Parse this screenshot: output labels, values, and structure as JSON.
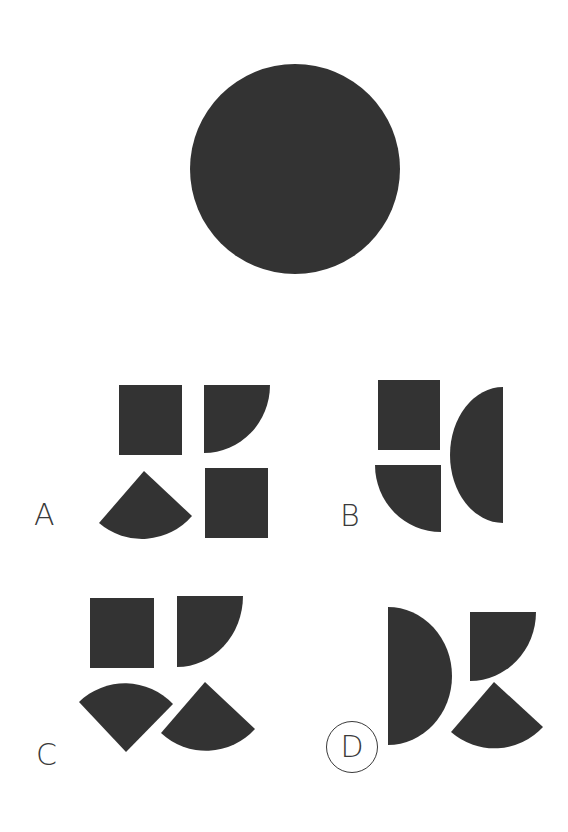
{
  "puzzle": {
    "target": {
      "shape": "circle",
      "color": "#333333"
    },
    "options": [
      {
        "label": "A",
        "selected": false,
        "pieces": [
          "square",
          "quarter-circle",
          "quarter-sector",
          "square"
        ]
      },
      {
        "label": "B",
        "selected": false,
        "pieces": [
          "square",
          "quarter-circle",
          "half-circle"
        ]
      },
      {
        "label": "C",
        "selected": false,
        "pieces": [
          "square",
          "quarter-circle",
          "quarter-sector",
          "quarter-sector"
        ]
      },
      {
        "label": "D",
        "selected": true,
        "pieces": [
          "half-circle",
          "quarter-circle",
          "quarter-sector"
        ]
      }
    ],
    "colors": {
      "shape_fill": "#333333",
      "label_text": "#3a3a3a",
      "background": "#ffffff"
    }
  }
}
